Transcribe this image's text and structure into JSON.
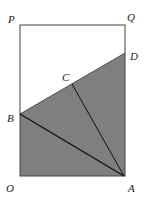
{
  "diagram": {
    "type": "geometry",
    "points": {
      "P": {
        "label": "P",
        "x": 20,
        "y": 25
      },
      "Q": {
        "label": "Q",
        "x": 125,
        "y": 25
      },
      "D": {
        "label": "D",
        "x": 125,
        "y": 53
      },
      "C": {
        "label": "C",
        "x": 72,
        "y": 84
      },
      "B": {
        "label": "B",
        "x": 20,
        "y": 114
      },
      "O": {
        "label": "O",
        "x": 20,
        "y": 176
      },
      "A": {
        "label": "A",
        "x": 124,
        "y": 176
      }
    },
    "labels": {
      "P": "P",
      "Q": "Q",
      "D": "D",
      "C": "C",
      "B": "B",
      "O": "O",
      "A": "A"
    },
    "shaded_region": [
      "B",
      "D",
      "A",
      "O"
    ],
    "segments": [
      [
        "P",
        "Q"
      ],
      [
        "Q",
        "A"
      ],
      [
        "P",
        "O"
      ],
      [
        "O",
        "A"
      ],
      [
        "B",
        "D"
      ],
      [
        "B",
        "A"
      ],
      [
        "C",
        "A"
      ]
    ],
    "colors": {
      "fill": "#7f7f7f",
      "stroke": "#1a1a1a",
      "background": "#ffffff"
    }
  }
}
